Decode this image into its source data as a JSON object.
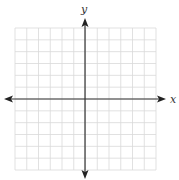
{
  "diagram": {
    "type": "coordinate-plane",
    "x_axis_label": "x",
    "y_axis_label": "y",
    "grid": {
      "columns": 12,
      "rows": 12,
      "color": "#d4d4d4"
    },
    "axis_color": "#333333"
  }
}
